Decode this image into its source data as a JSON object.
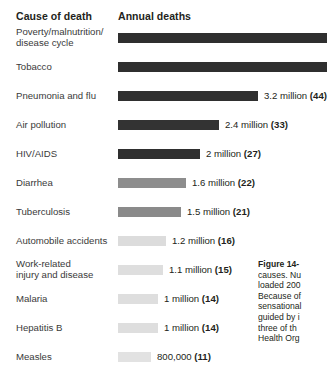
{
  "headers": {
    "cause": "Cause of death",
    "annual": "Annual deaths"
  },
  "caption": {
    "title": "Figure 14-",
    "body": "causes. Nu\nloaded 200\nBecause of\nsensational\nguided by i\nthree of th\nHealth Org"
  },
  "chart_data": {
    "type": "bar",
    "title": "Annual deaths",
    "xlabel": "",
    "ylabel": "Cause of death",
    "grid": false,
    "legend": "none",
    "orientation": "horizontal",
    "note": "Two longest bars (Poverty/malnutrition/disease cycle and Tobacco) extend past the right edge of the cropped image; their numeric labels are not visible.",
    "categories": [
      "Poverty/malnutrition/\ndisease cycle",
      "Tobacco",
      "Pneumonia and flu",
      "Air pollution",
      "HIV/AIDS",
      "Diarrhea",
      "Tuberculosis",
      "Automobile accidents",
      "Work-related\ninjury and disease",
      "Malaria",
      "Hepatitis B",
      "Measles"
    ],
    "values": [
      null,
      null,
      3.2,
      2.4,
      2.0,
      1.6,
      1.5,
      1.2,
      1.1,
      1.0,
      1.0,
      0.8
    ],
    "value_labels": [
      "",
      "",
      "3.2 million",
      "2.4 million",
      "2 million",
      "1.6 million",
      "1.5 million",
      "1.2 million",
      "1.1 million",
      "1 million",
      "1 million",
      "800,000"
    ],
    "bold_values": [
      "",
      "",
      "(44)",
      "(33)",
      "(27)",
      "(22)",
      "(21)",
      "(16)",
      "(15)",
      "(14)",
      "(14)",
      "(11)"
    ],
    "bar_colors": [
      "#2f2f2f",
      "#2f2f2f",
      "#2f2f2f",
      "#333333",
      "#2f2f2f",
      "#8d8d8d",
      "#8a8a8a",
      "#dcdcdc",
      "#dedede",
      "#dedede",
      "#dedede",
      "#e2e2e2"
    ]
  },
  "rows": [
    {
      "label": "Poverty/malnutrition/\ndisease cycle",
      "label_lines": 2,
      "bar_width": 209,
      "bar_color": "#2f2f2f",
      "value": "",
      "bold": ""
    },
    {
      "label": "Tobacco",
      "label_lines": 1,
      "bar_width": 209,
      "bar_color": "#2f2f2f",
      "value": "",
      "bold": ""
    },
    {
      "label": "Pneumonia and flu",
      "label_lines": 1,
      "bar_width": 140,
      "bar_color": "#2f2f2f",
      "value": "3.2 million ",
      "bold": "(44)"
    },
    {
      "label": "Air pollution",
      "label_lines": 1,
      "bar_width": 101,
      "bar_color": "#333333",
      "value": "2.4 million ",
      "bold": "(33)"
    },
    {
      "label": "HIV/AIDS",
      "label_lines": 1,
      "bar_width": 82,
      "bar_color": "#2f2f2f",
      "value": "2 million ",
      "bold": "(27)"
    },
    {
      "label": "Diarrhea",
      "label_lines": 1,
      "bar_width": 68,
      "bar_color": "#8d8d8d",
      "value": "1.6 million ",
      "bold": "(22)"
    },
    {
      "label": "Tuberculosis",
      "label_lines": 1,
      "bar_width": 63,
      "bar_color": "#8a8a8a",
      "value": "1.5 million ",
      "bold": "(21)"
    },
    {
      "label": "Automobile accidents",
      "label_lines": 1,
      "bar_width": 48,
      "bar_color": "#dcdcdc",
      "value": "1.2 million ",
      "bold": "(16)"
    },
    {
      "label": "Work-related\ninjury and disease",
      "label_lines": 2,
      "bar_width": 45,
      "bar_color": "#dedede",
      "value": "1.1 million ",
      "bold": "(15)"
    },
    {
      "label": "Malaria",
      "label_lines": 1,
      "bar_width": 40,
      "bar_color": "#dedede",
      "value": "1 million ",
      "bold": "(14)"
    },
    {
      "label": "Hepatitis B",
      "label_lines": 1,
      "bar_width": 40,
      "bar_color": "#dedede",
      "value": "1 million ",
      "bold": "(14)"
    },
    {
      "label": "Measles",
      "label_lines": 1,
      "bar_width": 33,
      "bar_color": "#e2e2e2",
      "value": "800,000 ",
      "bold": "(11)"
    }
  ]
}
